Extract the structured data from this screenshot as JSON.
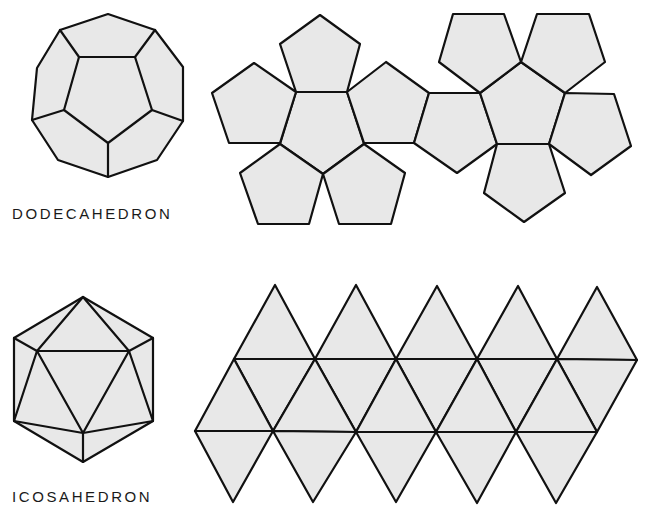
{
  "figure": {
    "dodecahedron": {
      "label": "DODECAHEDRON",
      "solid": {
        "outline": [
          [
            108,
            14
          ],
          [
            155,
            30
          ],
          [
            183,
            67
          ],
          [
            183,
            121
          ],
          [
            157,
            160
          ],
          [
            108,
            177
          ],
          [
            58,
            160
          ],
          [
            32,
            120
          ],
          [
            37,
            68
          ],
          [
            60,
            30
          ]
        ],
        "inner_pentagon": [
          [
            79,
            57
          ],
          [
            135,
            57
          ],
          [
            152,
            110
          ],
          [
            108,
            143
          ],
          [
            64,
            110
          ]
        ],
        "spokes": [
          [
            [
              79,
              57
            ],
            [
              60,
              30
            ]
          ],
          [
            [
              135,
              57
            ],
            [
              155,
              30
            ]
          ],
          [
            [
              152,
              110
            ],
            [
              183,
              121
            ]
          ],
          [
            [
              108,
              143
            ],
            [
              108,
              177
            ]
          ],
          [
            [
              64,
              110
            ],
            [
              32,
              120
            ]
          ]
        ]
      },
      "net": {
        "faces": [
          [
            [
              296,
              92
            ],
            [
              347,
              92
            ],
            [
              364,
              144
            ],
            [
              323,
              174
            ],
            [
              280,
              144
            ]
          ],
          [
            [
              320,
              15
            ],
            [
              360,
              44
            ],
            [
              347,
              92
            ],
            [
              296,
              92
            ],
            [
              280,
              44
            ]
          ],
          [
            [
              254,
              63
            ],
            [
              296,
              92
            ],
            [
              280,
              143
            ],
            [
              229,
              143
            ],
            [
              212,
              93
            ]
          ],
          [
            [
              347,
              92
            ],
            [
              386,
              62
            ],
            [
              429,
              93
            ],
            [
              414,
              143
            ],
            [
              364,
              143
            ]
          ],
          [
            [
              280,
              144
            ],
            [
              323,
              174
            ],
            [
              309,
              224
            ],
            [
              258,
              224
            ],
            [
              240,
              173
            ]
          ],
          [
            [
              323,
              174
            ],
            [
              364,
              144
            ],
            [
              405,
              173
            ],
            [
              391,
              224
            ],
            [
              339,
              224
            ]
          ],
          [
            [
              429,
              93
            ],
            [
              480,
              93
            ],
            [
              497,
              144
            ],
            [
              457,
              173
            ],
            [
              414,
              143
            ]
          ],
          [
            [
              521,
              62
            ],
            [
              565,
              93
            ],
            [
              549,
              144
            ],
            [
              497,
              144
            ],
            [
              480,
              93
            ]
          ],
          [
            [
              453,
              14
            ],
            [
              504,
              14
            ],
            [
              521,
              62
            ],
            [
              480,
              93
            ],
            [
              439,
              62
            ]
          ],
          [
            [
              537,
              14
            ],
            [
              589,
              14
            ],
            [
              605,
              62
            ],
            [
              565,
              93
            ],
            [
              521,
              62
            ]
          ],
          [
            [
              565,
              93
            ],
            [
              614,
              94
            ],
            [
              631,
              146
            ],
            [
              591,
              175
            ],
            [
              549,
              144
            ]
          ],
          [
            [
              497,
              144
            ],
            [
              549,
              144
            ],
            [
              565,
              193
            ],
            [
              524,
              222
            ],
            [
              484,
              193
            ]
          ]
        ]
      }
    },
    "icosahedron": {
      "label": "ICOSAHEDRON",
      "solid": {
        "outline": [
          [
            83,
            297
          ],
          [
            153,
            338
          ],
          [
            153,
            421
          ],
          [
            83,
            462
          ],
          [
            14,
            421
          ],
          [
            14,
            338
          ]
        ],
        "inner_triangle": [
          [
            37,
            351
          ],
          [
            129,
            351
          ],
          [
            83,
            433
          ]
        ],
        "edges": [
          [
            [
              83,
              297
            ],
            [
              37,
              351
            ]
          ],
          [
            [
              83,
              297
            ],
            [
              129,
              351
            ]
          ],
          [
            [
              14,
              338
            ],
            [
              37,
              351
            ]
          ],
          [
            [
              153,
              338
            ],
            [
              129,
              351
            ]
          ],
          [
            [
              14,
              421
            ],
            [
              37,
              351
            ]
          ],
          [
            [
              153,
              421
            ],
            [
              129,
              351
            ]
          ],
          [
            [
              14,
              421
            ],
            [
              83,
              433
            ]
          ],
          [
            [
              153,
              421
            ],
            [
              83,
              433
            ]
          ],
          [
            [
              83,
              433
            ],
            [
              83,
              462
            ]
          ]
        ]
      },
      "net": {
        "top_peaks": [
          [
            275,
            285
          ],
          [
            356,
            285
          ],
          [
            437,
            286
          ],
          [
            518,
            286
          ],
          [
            597,
            287
          ]
        ],
        "upper_line": [
          [
            234,
            359
          ],
          [
            315,
            359
          ],
          [
            396,
            359
          ],
          [
            477,
            359
          ],
          [
            557,
            359
          ],
          [
            637,
            360
          ]
        ],
        "lower_line": [
          [
            195,
            431
          ],
          [
            273,
            431
          ],
          [
            356,
            432
          ],
          [
            436,
            432
          ],
          [
            516,
            432
          ],
          [
            597,
            432
          ]
        ],
        "bottoms": [
          [
            233,
            502
          ],
          [
            313,
            502
          ],
          [
            396,
            502
          ],
          [
            477,
            503
          ],
          [
            556,
            503
          ]
        ]
      }
    },
    "colors": {
      "face_fill": "#e8e8e8",
      "stroke": "#111111",
      "background": "#ffffff"
    }
  }
}
